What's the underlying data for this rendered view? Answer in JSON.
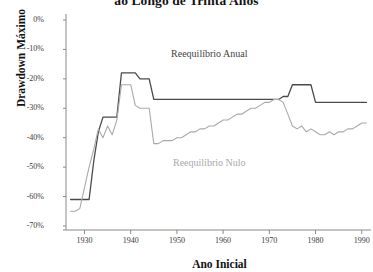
{
  "chart_data": {
    "type": "line",
    "title": "ao Longo de Trinta Anos",
    "xlabel": "Ano Inicial",
    "ylabel": "Drawdown Máximo",
    "xlim": [
      1926,
      1992
    ],
    "ylim": [
      -70,
      0
    ],
    "grid": false,
    "legend_position": "inline-annotations",
    "xticks": [
      1930,
      1940,
      1950,
      1960,
      1970,
      1980,
      1990
    ],
    "xtick_labels": [
      "1930",
      "1940",
      "1950",
      "1960",
      "1970",
      "1980",
      "1990"
    ],
    "yticks": [
      0,
      -10,
      -20,
      -30,
      -40,
      -50,
      -60,
      -70
    ],
    "ytick_labels": [
      "0%",
      "-10%",
      "-20%",
      "-30%",
      "-40%",
      "-50%",
      "-60%",
      "-70%"
    ],
    "annotations": [
      {
        "text": "Reequilíbrio Anual",
        "x": 1957,
        "y": -12,
        "color": "#3f3f3f"
      },
      {
        "text": "Reequilíbrio Nulo",
        "x": 1957,
        "y": -49,
        "color": "#a8a8a8"
      }
    ],
    "series": [
      {
        "name": "Reequilíbrio Anual",
        "color": "#4a4a4a",
        "width": 1.3,
        "x": [
          1927,
          1928,
          1929,
          1930,
          1931,
          1932,
          1933,
          1934,
          1935,
          1936,
          1937,
          1938,
          1939,
          1940,
          1941,
          1942,
          1943,
          1944,
          1945,
          1946,
          1947,
          1948,
          1949,
          1950,
          1951,
          1952,
          1953,
          1954,
          1955,
          1956,
          1957,
          1958,
          1959,
          1960,
          1961,
          1962,
          1963,
          1964,
          1965,
          1966,
          1967,
          1968,
          1969,
          1970,
          1971,
          1972,
          1973,
          1974,
          1975,
          1976,
          1977,
          1978,
          1979,
          1980,
          1981,
          1982,
          1983,
          1984,
          1985,
          1986,
          1987,
          1988,
          1989,
          1990,
          1991
        ],
        "y": [
          -61,
          -61,
          -61,
          -61,
          -61,
          -48,
          -38,
          -33,
          -33,
          -33,
          -33,
          -18,
          -18,
          -18,
          -18,
          -20,
          -20,
          -20,
          -27,
          -27,
          -27,
          -27,
          -27,
          -27,
          -27,
          -27,
          -27,
          -27,
          -27,
          -27,
          -27,
          -27,
          -27,
          -27,
          -27,
          -27,
          -27,
          -27,
          -27,
          -27,
          -27,
          -27,
          -27,
          -27,
          -27,
          -27,
          -26,
          -26,
          -22,
          -22,
          -22,
          -22,
          -22,
          -28,
          -28,
          -28,
          -28,
          -28,
          -28,
          -28,
          -28,
          -28,
          -28,
          -28,
          -28
        ]
      },
      {
        "name": "Reequilíbrio Nulo",
        "color": "#a9a9a9",
        "width": 1.1,
        "x": [
          1927,
          1928,
          1929,
          1930,
          1931,
          1932,
          1933,
          1934,
          1935,
          1936,
          1937,
          1938,
          1939,
          1940,
          1941,
          1942,
          1943,
          1944,
          1945,
          1946,
          1947,
          1948,
          1949,
          1950,
          1951,
          1952,
          1953,
          1954,
          1955,
          1956,
          1957,
          1958,
          1959,
          1960,
          1961,
          1962,
          1963,
          1964,
          1965,
          1966,
          1967,
          1968,
          1969,
          1970,
          1971,
          1972,
          1973,
          1974,
          1975,
          1976,
          1977,
          1978,
          1979,
          1980,
          1981,
          1982,
          1983,
          1984,
          1985,
          1986,
          1987,
          1988,
          1989,
          1990,
          1991
        ],
        "y": [
          -65,
          -65,
          -64,
          -57,
          -50,
          -44,
          -37,
          -40,
          -36,
          -39,
          -34,
          -22,
          -22,
          -22,
          -29,
          -30,
          -30,
          -30,
          -42,
          -42,
          -41,
          -41,
          -41,
          -40,
          -40,
          -39,
          -38,
          -38,
          -37,
          -37,
          -36,
          -36,
          -35,
          -34,
          -34,
          -33,
          -32,
          -32,
          -31,
          -30,
          -30,
          -29,
          -28,
          -28,
          -27,
          -27,
          -28,
          -32,
          -36,
          -37,
          -36,
          -38,
          -37,
          -38,
          -39,
          -39,
          -38,
          -39,
          -38,
          -38,
          -37,
          -37,
          -36,
          -35,
          -35
        ]
      }
    ]
  }
}
